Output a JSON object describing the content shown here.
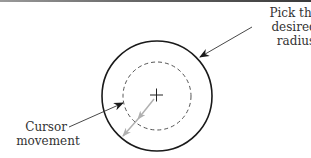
{
  "figure": {
    "labels": {
      "pick": [
        "Pick the",
        "desired",
        "radius"
      ],
      "cursor": [
        "Cursor",
        "movement"
      ]
    },
    "colors": {
      "stroke": "#1a1a1a",
      "dashed": "#555555",
      "cursor_arrow": "#b0b0b0",
      "text": "#333333"
    },
    "geometry": {
      "center": [
        157,
        96
      ],
      "outer_radius": 55,
      "inner_radius": 34
    }
  }
}
